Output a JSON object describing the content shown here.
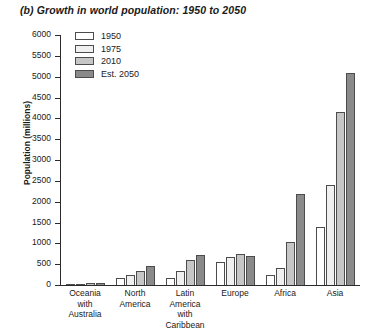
{
  "chart_data": {
    "type": "bar",
    "title": "(b) Growth in world population: 1950 to 2050",
    "xlabel": "",
    "ylabel": "Population (millions)",
    "ylim": [
      0,
      6000
    ],
    "ytick_step": 500,
    "yticks": [
      0,
      500,
      1000,
      1500,
      2000,
      2500,
      3000,
      3500,
      4000,
      4500,
      5000,
      5500,
      6000
    ],
    "grid": false,
    "legend_position": "top-left inside plot",
    "categories": [
      "Oceania\nwith\nAustralia",
      "North\nAmerica",
      "Latin\nAmerica\nwith Caribbean",
      "Europe",
      "Africa",
      "Asia"
    ],
    "series": [
      {
        "name": "1950",
        "color": "#ffffff",
        "values": [
          13,
          172,
          170,
          550,
          230,
          1400
        ]
      },
      {
        "name": "1975",
        "color": "#f0f0f0",
        "values": [
          21,
          243,
          325,
          675,
          420,
          2400
        ]
      },
      {
        "name": "2010",
        "color": "#c6c6c6",
        "values": [
          37,
          345,
          590,
          735,
          1030,
          4160
        ]
      },
      {
        "name": "Est. 2050",
        "color": "#8a8a8a",
        "values": [
          50,
          450,
          730,
          690,
          2190,
          5100
        ]
      }
    ]
  },
  "legend": {
    "items": [
      {
        "label": "1950"
      },
      {
        "label": "1975"
      },
      {
        "label": "2010"
      },
      {
        "label": "Est. 2050"
      }
    ]
  }
}
